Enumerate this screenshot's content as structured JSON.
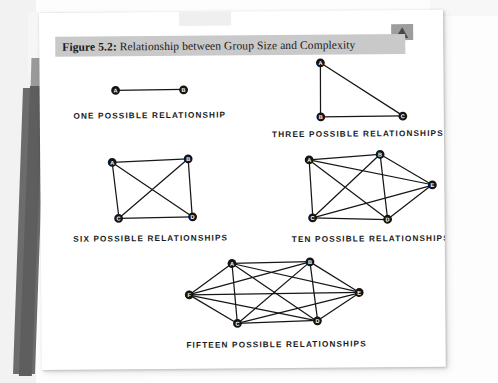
{
  "figure": {
    "caption_label": "Figure 5.2:",
    "caption_text": " Relationship between Group Size and Complexity",
    "caption_full": "Figure 5.2: Relationship between Group Size and Complexity",
    "caption_bar_color": "#c9c9c9",
    "page_color": "#ffffff",
    "ink_color": "#141414"
  },
  "diagrams": [
    {
      "id": "two-node",
      "label": "ONE POSSIBLE RELATIONSHIP",
      "node_count": 2,
      "edge_count": 1,
      "nodes": [
        {
          "letter": "A",
          "x": 76,
          "y": 34
        },
        {
          "letter": "B",
          "x": 144,
          "y": 34
        }
      ],
      "edges": [
        [
          "A",
          "B"
        ]
      ],
      "label_x": 110,
      "label_y": 62
    },
    {
      "id": "three-node",
      "label": "THREE POSSIBLE RELATIONSHIPS",
      "node_count": 3,
      "edge_count": 3,
      "nodes": [
        {
          "letter": "A",
          "x": 281,
          "y": 8
        },
        {
          "letter": "B",
          "x": 281,
          "y": 62
        },
        {
          "letter": "C",
          "x": 363,
          "y": 62
        }
      ],
      "edges": [
        [
          "A",
          "B"
        ],
        [
          "A",
          "C"
        ],
        [
          "B",
          "C"
        ]
      ],
      "label_x": 318,
      "label_y": 82
    },
    {
      "id": "four-node",
      "label": "SIX POSSIBLE RELATIONSHIPS",
      "node_count": 4,
      "edge_count": 6,
      "nodes": [
        {
          "letter": "A",
          "x": 72,
          "y": 106
        },
        {
          "letter": "B",
          "x": 148,
          "y": 103
        },
        {
          "letter": "C",
          "x": 78,
          "y": 162
        },
        {
          "letter": "D",
          "x": 152,
          "y": 161
        }
      ],
      "edges": [
        [
          "A",
          "B"
        ],
        [
          "A",
          "C"
        ],
        [
          "A",
          "D"
        ],
        [
          "B",
          "C"
        ],
        [
          "B",
          "D"
        ],
        [
          "C",
          "D"
        ]
      ],
      "label_x": 110,
      "label_y": 185
    },
    {
      "id": "five-node",
      "label": "TEN POSSIBLE RELATIONSHIPS",
      "node_count": 5,
      "edge_count": 10,
      "nodes": [
        {
          "letter": "A",
          "x": 269,
          "y": 105
        },
        {
          "letter": "B",
          "x": 340,
          "y": 100
        },
        {
          "letter": "C",
          "x": 272,
          "y": 163
        },
        {
          "letter": "D",
          "x": 347,
          "y": 165
        },
        {
          "letter": "E",
          "x": 392,
          "y": 131
        }
      ],
      "edges": [
        [
          "A",
          "B"
        ],
        [
          "A",
          "C"
        ],
        [
          "A",
          "D"
        ],
        [
          "A",
          "E"
        ],
        [
          "B",
          "C"
        ],
        [
          "B",
          "D"
        ],
        [
          "B",
          "E"
        ],
        [
          "C",
          "D"
        ],
        [
          "C",
          "E"
        ],
        [
          "D",
          "E"
        ]
      ],
      "label_x": 330,
      "label_y": 187
    },
    {
      "id": "six-node",
      "label": "FIFTEEN POSSIBLE RELATIONSHIPS",
      "node_count": 6,
      "edge_count": 15,
      "nodes": [
        {
          "letter": "A",
          "x": 191,
          "y": 208
        },
        {
          "letter": "B",
          "x": 269,
          "y": 207
        },
        {
          "letter": "C",
          "x": 196,
          "y": 268
        },
        {
          "letter": "D",
          "x": 276,
          "y": 266
        },
        {
          "letter": "E",
          "x": 318,
          "y": 238
        },
        {
          "letter": "F",
          "x": 148,
          "y": 239
        }
      ],
      "edges": [
        [
          "A",
          "B"
        ],
        [
          "A",
          "C"
        ],
        [
          "A",
          "D"
        ],
        [
          "A",
          "E"
        ],
        [
          "A",
          "F"
        ],
        [
          "B",
          "C"
        ],
        [
          "B",
          "D"
        ],
        [
          "B",
          "E"
        ],
        [
          "B",
          "F"
        ],
        [
          "C",
          "D"
        ],
        [
          "C",
          "E"
        ],
        [
          "C",
          "F"
        ],
        [
          "D",
          "E"
        ],
        [
          "D",
          "F"
        ],
        [
          "E",
          "F"
        ]
      ],
      "label_x": 235,
      "label_y": 292
    }
  ]
}
